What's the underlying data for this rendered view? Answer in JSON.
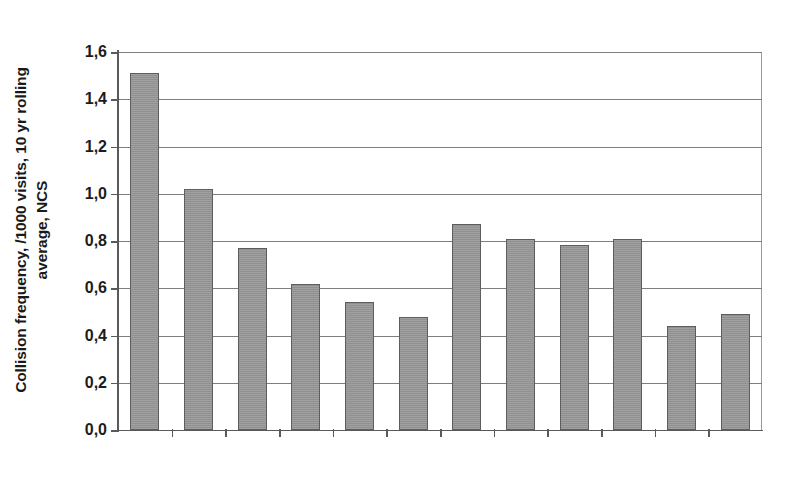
{
  "chart_data": {
    "type": "bar",
    "title": "",
    "xlabel": "",
    "ylabel": "Collision frequency, /1000 visits, 10 yr rolling average, NCS",
    "ylabel_line1": "Collision frequency, /1000 visits, 10 yr rolling",
    "ylabel_line2": "average, NCS",
    "categories": [
      "2000",
      "2001",
      "2002",
      "2003",
      "2004",
      "2005",
      "2006",
      "2007",
      "2008",
      "2009",
      "2010",
      "2011"
    ],
    "values": [
      1.51,
      1.02,
      0.77,
      0.62,
      0.54,
      0.48,
      0.87,
      0.81,
      0.785,
      0.81,
      0.44,
      0.49
    ],
    "ylim": [
      0.0,
      1.6
    ],
    "ytick_values": [
      0.0,
      0.2,
      0.4,
      0.6,
      0.8,
      1.0,
      1.2,
      1.4,
      1.6
    ],
    "ytick_labels": [
      "0,0",
      "0,2",
      "0,4",
      "0,6",
      "0,8",
      "1,0",
      "1,2",
      "1,4",
      "1,6"
    ],
    "decimal_separator": ",",
    "grid": true,
    "grid_axis": "y",
    "legend": false,
    "legend_position": "none",
    "bar_color": "#969696",
    "bar_edge_color": "#5d5d5d",
    "grid_color": "#7d7d7d",
    "axis_color": "#5a5a5a",
    "background_color": "#ffffff"
  }
}
